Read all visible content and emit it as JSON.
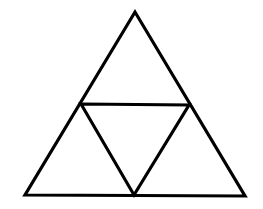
{
  "diagram": {
    "title": "",
    "background": "#ffffff",
    "stroke_color": "#000000",
    "stroke_width": 3.2,
    "outer_triangle": {
      "apex": [
        135,
        12
      ],
      "bottom_left": [
        25,
        195
      ],
      "bottom_right": [
        245,
        196
      ]
    },
    "inner_triangle": {
      "left": [
        81,
        104
      ],
      "right": [
        189,
        105
      ],
      "bottom": [
        134,
        195
      ]
    },
    "sub_triangles": [
      {
        "name": "top",
        "points": [
          [
            135,
            12
          ],
          [
            81,
            104
          ],
          [
            189,
            105
          ]
        ]
      },
      {
        "name": "bottom-left",
        "points": [
          [
            81,
            104
          ],
          [
            25,
            195
          ],
          [
            134,
            195
          ]
        ]
      },
      {
        "name": "bottom-right",
        "points": [
          [
            189,
            105
          ],
          [
            134,
            195
          ],
          [
            245,
            196
          ]
        ]
      },
      {
        "name": "center-inverted",
        "points": [
          [
            81,
            104
          ],
          [
            189,
            105
          ],
          [
            134,
            195
          ]
        ]
      }
    ]
  }
}
